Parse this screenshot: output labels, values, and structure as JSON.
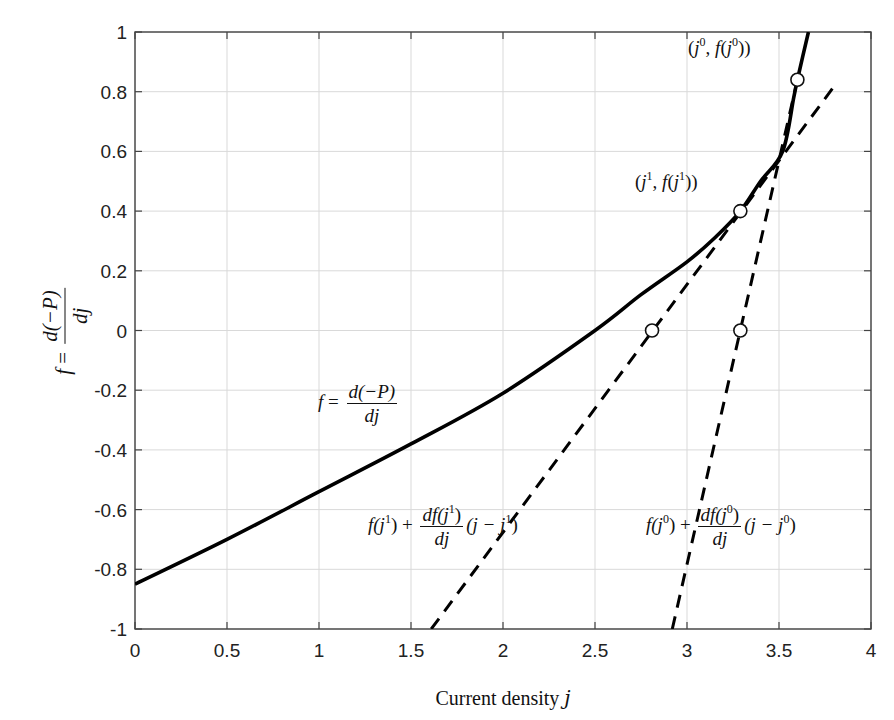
{
  "chart_data": {
    "type": "line",
    "title": "",
    "xlabel": "Current density j",
    "ylabel": "f = d(-P)/dj",
    "xlim": [
      0,
      4
    ],
    "ylim": [
      -1,
      1
    ],
    "grid": true,
    "legend": null,
    "x_ticks": [
      0,
      0.5,
      1,
      1.5,
      2,
      2.5,
      3,
      3.5,
      4
    ],
    "x_tick_labels": [
      "0",
      "0.5",
      "1",
      "1.5",
      "2",
      "2.5",
      "3",
      "3.5",
      "4"
    ],
    "y_ticks": [
      -1,
      -0.8,
      -0.6,
      -0.4,
      -0.2,
      0,
      0.2,
      0.4,
      0.6,
      0.8,
      1
    ],
    "y_tick_labels": [
      "-1",
      "-0.8",
      "-0.6",
      "-0.4",
      "-0.2",
      "0",
      "0.2",
      "0.4",
      "0.6",
      "0.8",
      "1"
    ],
    "series": [
      {
        "name": "f = d(-P)/dj",
        "style": "solid",
        "color": "#000000",
        "x": [
          0,
          0.5,
          1.0,
          1.5,
          2.0,
          2.5,
          2.75,
          3.0,
          3.15,
          3.29,
          3.4,
          3.52,
          3.58,
          3.6,
          3.66
        ],
        "y": [
          -0.85,
          -0.7,
          -0.54,
          -0.38,
          -0.21,
          0.0,
          0.12,
          0.23,
          0.31,
          0.4,
          0.5,
          0.6,
          0.78,
          0.84,
          1.0
        ]
      },
      {
        "name": "f(j^1) + df(j^1)/dj (j - j^1)",
        "style": "dashed",
        "color": "#000000",
        "x": [
          1.61,
          3.79
        ],
        "y": [
          -1.0,
          0.81
        ]
      },
      {
        "name": "f(j^0) + df(j^0)/dj (j - j^0)",
        "style": "dashed",
        "color": "#000000",
        "x": [
          2.92,
          3.6
        ],
        "y": [
          -1.0,
          0.84
        ]
      }
    ],
    "markers": [
      {
        "name": "(j^0, f(j^0))",
        "x": 3.6,
        "y": 0.84
      },
      {
        "name": "(j^1, f(j^1))",
        "x": 3.29,
        "y": 0.4
      },
      {
        "name": "tangent at j^1 zero crossing",
        "x": 2.81,
        "y": 0.0
      },
      {
        "name": "tangent at j^0 zero crossing (j^1)",
        "x": 3.29,
        "y": 0.0
      }
    ],
    "annotations": [
      {
        "text": "(j^0, f(j^0))",
        "x": 3.3,
        "y": 0.9
      },
      {
        "text": "(j^1, f(j^1))",
        "x": 2.7,
        "y": 0.45
      },
      {
        "text": "f = d(-P)/dj",
        "x": 1.1,
        "y": -0.3
      },
      {
        "text": "f(j^1) + df(j^1)/dj (j - j^1)",
        "x": 1.3,
        "y": -0.67
      },
      {
        "text": "f(j^0) + df(j^0)/dj (j - j^0)",
        "x": 2.9,
        "y": -0.67
      }
    ]
  },
  "labels": {
    "xlabel_text": "Current density ",
    "xlabel_var": "j",
    "ylabel_f": "f",
    "ylabel_eq": " = ",
    "ylabel_num": "d(−P)",
    "ylabel_den": "dj",
    "ann_j0_point": {
      "open": "(",
      "j": "j",
      "sup": "0",
      "mid": ", ",
      "f": "f",
      "open2": "(",
      "j2": "j",
      "sup2": "0",
      "close": "))"
    },
    "ann_j1_point": {
      "open": "(",
      "j": "j",
      "sup": "1",
      "mid": ", ",
      "f": "f",
      "open2": "(",
      "j2": "j",
      "sup2": "1",
      "close": "))"
    },
    "ann_curve": {
      "f": "f",
      "eq": " = ",
      "num": "d(−P)",
      "den": "dj"
    },
    "ann_tangent1": {
      "pre": "f(j",
      "sup": "1",
      "post": ") + ",
      "num_pre": "df(j",
      "num_sup": "1",
      "num_post": ")",
      "den": "dj",
      "tail_pre": "(j − j",
      "tail_sup": "1",
      "tail_post": ")"
    },
    "ann_tangent0": {
      "pre": "f(j",
      "sup": "0",
      "post": ") + ",
      "num_pre": "df(j",
      "num_sup": "0",
      "num_post": ")",
      "den": "dj",
      "tail_pre": "(j − j",
      "tail_sup": "0",
      "tail_post": ")"
    }
  },
  "colors": {
    "curve": "#000000",
    "grid": "#d9d9d9",
    "axes": "#444444",
    "background": "#ffffff"
  }
}
